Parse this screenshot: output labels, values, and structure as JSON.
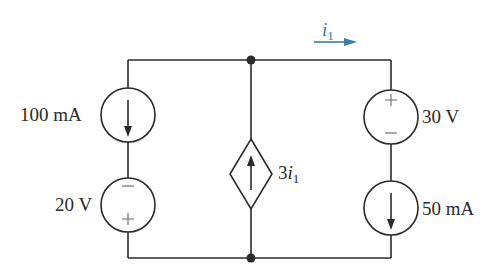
{
  "diagram": {
    "type": "electrical-circuit",
    "colors": {
      "wire": "#2b2b2b",
      "annotation": "#3a7ca5",
      "background": "#ffffff"
    },
    "nodes": [
      "top-node",
      "bottom-node"
    ],
    "components": [
      {
        "id": "cs-100ma",
        "kind": "independent-current-source",
        "label": "100 mA",
        "direction": "down",
        "branch": "left"
      },
      {
        "id": "vs-20v",
        "kind": "independent-voltage-source",
        "label": "20 V",
        "polarity_top": "−",
        "polarity_bottom": "+",
        "branch": "left"
      },
      {
        "id": "dep-cs",
        "kind": "dependent-current-source",
        "label_prefix": "3",
        "label_var": "i",
        "label_sub": "1",
        "direction": "up",
        "branch": "middle"
      },
      {
        "id": "vs-30v",
        "kind": "independent-voltage-source",
        "label": "30 V",
        "polarity_top": "+",
        "polarity_bottom": "−",
        "branch": "right"
      },
      {
        "id": "cs-50ma",
        "kind": "independent-current-source",
        "label": "50 mA",
        "direction": "down",
        "branch": "right"
      }
    ],
    "current_annotation": {
      "var": "i",
      "sub": "1",
      "direction": "right"
    }
  },
  "labels": {
    "cs_100ma": "100 mA",
    "vs_20v": "20 V",
    "dep_prefix": "3",
    "dep_var": "i",
    "dep_sub": "1",
    "vs_30v": "30 V",
    "cs_50ma": "50 mA",
    "i1_var": "i",
    "i1_sub": "1",
    "plus": "+",
    "minus": "−"
  }
}
